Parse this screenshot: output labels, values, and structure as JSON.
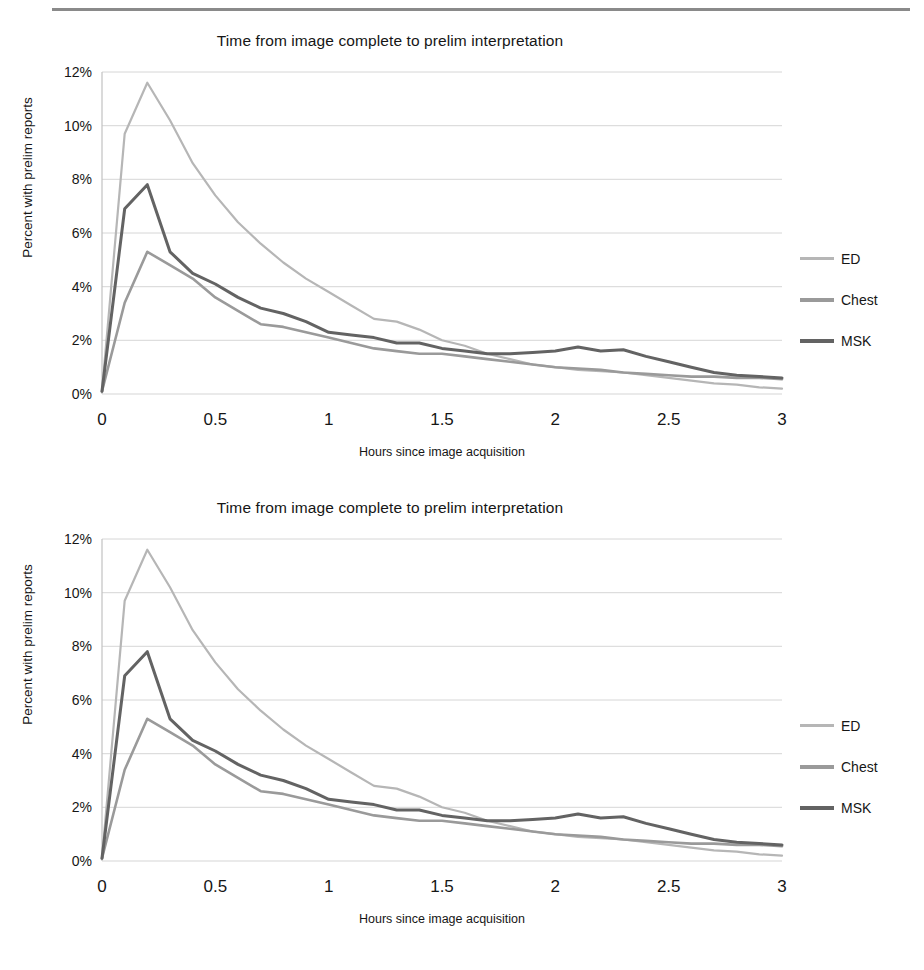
{
  "chart_data": [
    {
      "type": "line",
      "title": "Time from image complete to prelim interpretation",
      "xlabel": "Hours since image acquisition",
      "ylabel": "Percent with prelim reports",
      "xlim": [
        0,
        3
      ],
      "ylim": [
        0,
        12
      ],
      "grid": true,
      "legend_position": "right",
      "xticks": [
        "0",
        "0.5",
        "1",
        "1.5",
        "2",
        "2.5",
        "3"
      ],
      "xtick_values": [
        0,
        0.5,
        1,
        1.5,
        2,
        2.5,
        3
      ],
      "yticks": [
        "0%",
        "2%",
        "4%",
        "6%",
        "8%",
        "10%",
        "12%"
      ],
      "ytick_values": [
        0,
        2,
        4,
        6,
        8,
        10,
        12
      ],
      "x": [
        0,
        0.1,
        0.2,
        0.3,
        0.4,
        0.5,
        0.6,
        0.7,
        0.8,
        0.9,
        1.0,
        1.1,
        1.2,
        1.3,
        1.4,
        1.5,
        1.6,
        1.7,
        1.8,
        1.9,
        2.0,
        2.1,
        2.2,
        2.3,
        2.4,
        2.5,
        2.6,
        2.7,
        2.8,
        2.9,
        3.0
      ],
      "series": [
        {
          "name": "ED",
          "color": "#b6b6b6",
          "values": [
            0.1,
            9.7,
            11.6,
            10.2,
            8.6,
            7.4,
            6.4,
            5.6,
            4.9,
            4.3,
            3.8,
            3.3,
            2.8,
            2.7,
            2.4,
            2.0,
            1.8,
            1.5,
            1.3,
            1.1,
            1.0,
            0.9,
            0.85,
            0.8,
            0.7,
            0.6,
            0.5,
            0.4,
            0.35,
            0.25,
            0.2
          ]
        },
        {
          "name": "Chest",
          "color": "#9a9a9a",
          "values": [
            0.1,
            3.4,
            5.3,
            4.8,
            4.3,
            3.6,
            3.1,
            2.6,
            2.5,
            2.3,
            2.1,
            1.9,
            1.7,
            1.6,
            1.5,
            1.5,
            1.4,
            1.3,
            1.2,
            1.1,
            1.0,
            0.95,
            0.9,
            0.8,
            0.75,
            0.7,
            0.65,
            0.65,
            0.6,
            0.6,
            0.55
          ]
        },
        {
          "name": "MSK",
          "color": "#636363",
          "values": [
            0.1,
            6.9,
            7.8,
            5.3,
            4.5,
            4.1,
            3.6,
            3.2,
            3.0,
            2.7,
            2.3,
            2.2,
            2.1,
            1.9,
            1.9,
            1.7,
            1.6,
            1.5,
            1.5,
            1.55,
            1.6,
            1.75,
            1.6,
            1.65,
            1.4,
            1.2,
            1.0,
            0.8,
            0.7,
            0.65,
            0.6
          ]
        }
      ]
    },
    {
      "type": "line",
      "title": "Time from image complete to prelim interpretation",
      "xlabel": "Hours since image acquisition",
      "ylabel": "Percent with prelim reports",
      "xlim": [
        0,
        3
      ],
      "ylim": [
        0,
        12
      ],
      "grid": true,
      "legend_position": "right",
      "xticks": [
        "0",
        "0.5",
        "1",
        "1.5",
        "2",
        "2.5",
        "3"
      ],
      "xtick_values": [
        0,
        0.5,
        1,
        1.5,
        2,
        2.5,
        3
      ],
      "yticks": [
        "0%",
        "2%",
        "4%",
        "6%",
        "8%",
        "10%",
        "12%"
      ],
      "ytick_values": [
        0,
        2,
        4,
        6,
        8,
        10,
        12
      ],
      "x": [
        0,
        0.1,
        0.2,
        0.3,
        0.4,
        0.5,
        0.6,
        0.7,
        0.8,
        0.9,
        1.0,
        1.1,
        1.2,
        1.3,
        1.4,
        1.5,
        1.6,
        1.7,
        1.8,
        1.9,
        2.0,
        2.1,
        2.2,
        2.3,
        2.4,
        2.5,
        2.6,
        2.7,
        2.8,
        2.9,
        3.0
      ],
      "series": [
        {
          "name": "ED",
          "color": "#b6b6b6",
          "values": [
            0.1,
            9.7,
            11.6,
            10.2,
            8.6,
            7.4,
            6.4,
            5.6,
            4.9,
            4.3,
            3.8,
            3.3,
            2.8,
            2.7,
            2.4,
            2.0,
            1.8,
            1.5,
            1.3,
            1.1,
            1.0,
            0.9,
            0.85,
            0.8,
            0.7,
            0.6,
            0.5,
            0.4,
            0.35,
            0.25,
            0.2
          ]
        },
        {
          "name": "Chest",
          "color": "#9a9a9a",
          "values": [
            0.1,
            3.4,
            5.3,
            4.8,
            4.3,
            3.6,
            3.1,
            2.6,
            2.5,
            2.3,
            2.1,
            1.9,
            1.7,
            1.6,
            1.5,
            1.5,
            1.4,
            1.3,
            1.2,
            1.1,
            1.0,
            0.95,
            0.9,
            0.8,
            0.75,
            0.7,
            0.65,
            0.65,
            0.6,
            0.6,
            0.55
          ]
        },
        {
          "name": "MSK",
          "color": "#636363",
          "values": [
            0.1,
            6.9,
            7.8,
            5.3,
            4.5,
            4.1,
            3.6,
            3.2,
            3.0,
            2.7,
            2.3,
            2.2,
            2.1,
            1.9,
            1.9,
            1.7,
            1.6,
            1.5,
            1.5,
            1.55,
            1.6,
            1.75,
            1.6,
            1.65,
            1.4,
            1.2,
            1.0,
            0.8,
            0.7,
            0.65,
            0.6
          ]
        }
      ]
    }
  ],
  "figures": [
    {
      "title": "Time from image complete to prelim interpretation",
      "ylabel": "Percent with prelim reports",
      "xlabel": "Hours since image acquisition",
      "legend": [
        {
          "label": "ED"
        },
        {
          "label": "Chest"
        },
        {
          "label": "MSK"
        }
      ]
    },
    {
      "title": "Time from image complete to prelim interpretation",
      "ylabel": "Percent with prelim reports",
      "xlabel": "Hours since image acquisition",
      "legend": [
        {
          "label": "ED"
        },
        {
          "label": "Chest"
        },
        {
          "label": "MSK"
        }
      ]
    }
  ],
  "colors": {
    "ed": "#b6b6b6",
    "chest": "#9a9a9a",
    "msk": "#636363",
    "grid": "#d6d6d6",
    "axis": "#c2c2c2",
    "text": "#161616",
    "rule": "#8a8a8a"
  }
}
